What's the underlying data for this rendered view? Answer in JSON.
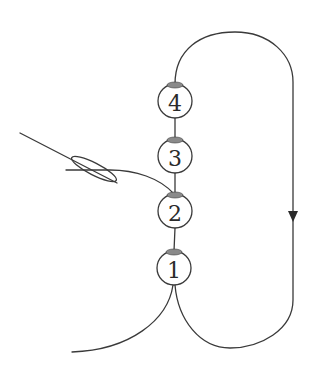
{
  "diagram": {
    "title": "",
    "type": "bead stringing / looping diagram",
    "colors": {
      "stroke": "#3a3a3a",
      "bead_fill": "#ffffff",
      "bead_hole": "#8a8a8a",
      "text": "#2a2a2a"
    },
    "beads": [
      {
        "id": "bead-4",
        "label": "4",
        "cx": 175,
        "cy": 101
      },
      {
        "id": "bead-3",
        "label": "3",
        "cx": 175,
        "cy": 156
      },
      {
        "id": "bead-2",
        "label": "2",
        "cx": 175,
        "cy": 211
      },
      {
        "id": "bead-1",
        "label": "1",
        "cx": 174,
        "cy": 268
      }
    ],
    "elements": {
      "needle": "needle with thread through eye entering bead 2 from the left",
      "loop": "thread loops from top of bead 4 around the right side back to bottom of bead 1",
      "direction_arrow": "downward arrow on the right side of the loop",
      "tail": "thread tail exiting bottom of bead 1 toward lower left"
    }
  }
}
